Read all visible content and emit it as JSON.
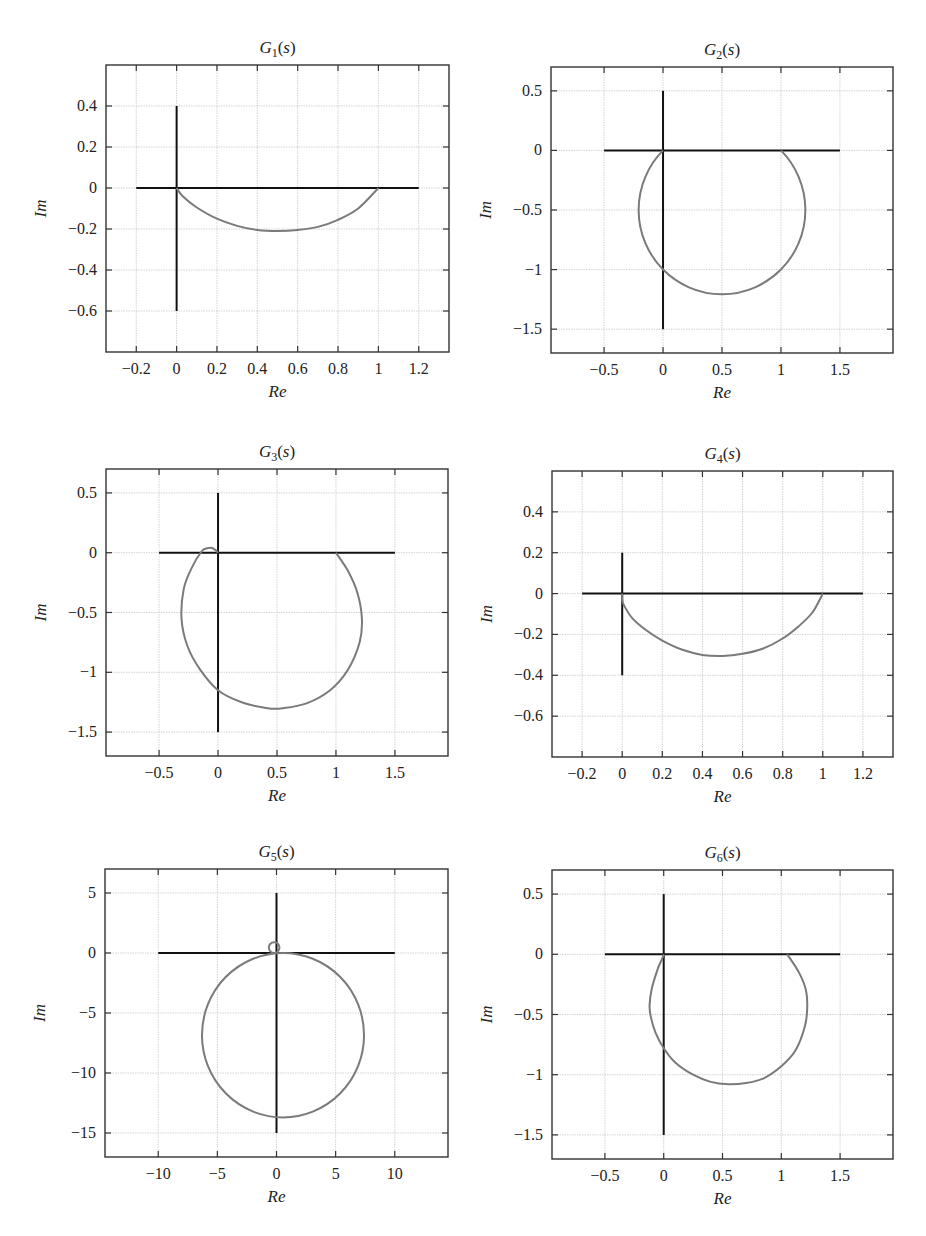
{
  "figure": {
    "layout": "3x2 grid of Nyquist plots"
  },
  "chart_data": [
    {
      "id": "g1",
      "type": "line",
      "title": "G1(s)",
      "title_parts": {
        "base": "G",
        "sub": "1",
        "arg": "s"
      },
      "xlabel": "Re",
      "ylabel": "Im",
      "xlim": [
        -0.35,
        1.35
      ],
      "ylim": [
        -0.8,
        0.6
      ],
      "xticks": [
        -0.2,
        0,
        0.2,
        0.4,
        0.6,
        0.8,
        1,
        1.2
      ],
      "xtick_labels": [
        "−0.2",
        "0",
        "0.2",
        "0.4",
        "0.6",
        "0.8",
        "1",
        "1.2"
      ],
      "yticks": [
        0.4,
        0.2,
        0,
        -0.2,
        -0.4,
        -0.6
      ],
      "ytick_labels": [
        "0.4",
        "0.2",
        "0",
        "−0.2",
        "−0.4",
        "−0.6"
      ],
      "grid": true,
      "box_px": {
        "left": 106,
        "top": 65,
        "right": 449,
        "bottom": 352
      },
      "axes_lines": {
        "h": [
          -0.2,
          1.2,
          0
        ],
        "v": [
          0,
          -0.6,
          0.4
        ]
      },
      "series": [
        {
          "name": "Nyquist curve",
          "shape": "arc",
          "points": [
            [
              1,
              0
            ],
            [
              0.9,
              -0.1
            ],
            [
              0.8,
              -0.155
            ],
            [
              0.7,
              -0.19
            ],
            [
              0.6,
              -0.205
            ],
            [
              0.5,
              -0.21
            ],
            [
              0.4,
              -0.205
            ],
            [
              0.3,
              -0.185
            ],
            [
              0.2,
              -0.15
            ],
            [
              0.1,
              -0.095
            ],
            [
              0.03,
              -0.04
            ],
            [
              0,
              0
            ]
          ]
        }
      ]
    },
    {
      "id": "g2",
      "type": "line",
      "title": "G2(s)",
      "title_parts": {
        "base": "G",
        "sub": "2",
        "arg": "s"
      },
      "xlabel": "Re",
      "ylabel": "Im",
      "xlim": [
        -0.95,
        1.95
      ],
      "ylim": [
        -1.7,
        0.7
      ],
      "xticks": [
        -0.5,
        0,
        0.5,
        1,
        1.5
      ],
      "xtick_labels": [
        "−0.5",
        "0",
        "0.5",
        "1",
        "1.5"
      ],
      "yticks": [
        0.5,
        0,
        -0.5,
        -1,
        -1.5
      ],
      "ytick_labels": [
        "0.5",
        "0",
        "−0.5",
        "−1",
        "−1.5"
      ],
      "grid": true,
      "box_px": {
        "left": 551,
        "top": 67,
        "right": 893,
        "bottom": 353
      },
      "axes_lines": {
        "h": [
          -0.5,
          1.5,
          0
        ],
        "v": [
          0,
          -1.5,
          0.5
        ]
      },
      "series": [
        {
          "name": "Nyquist curve",
          "shape": "circle",
          "center": [
            0.5,
            -0.5
          ],
          "radius": 0.707,
          "from": [
            1,
            0
          ],
          "to": [
            0,
            0
          ],
          "clockwise": true
        }
      ]
    },
    {
      "id": "g3",
      "type": "line",
      "title": "G3(s)",
      "title_parts": {
        "base": "G",
        "sub": "3",
        "arg": "s"
      },
      "xlabel": "Re",
      "ylabel": "Im",
      "xlim": [
        -0.95,
        1.95
      ],
      "ylim": [
        -1.7,
        0.7
      ],
      "xticks": [
        -0.5,
        0,
        0.5,
        1,
        1.5
      ],
      "xtick_labels": [
        "−0.5",
        "0",
        "0.5",
        "1",
        "1.5"
      ],
      "yticks": [
        0.5,
        0,
        -0.5,
        -1,
        -1.5
      ],
      "ytick_labels": [
        "0.5",
        "0",
        "−0.5",
        "−1",
        "−1.5"
      ],
      "grid": true,
      "box_px": {
        "left": 106,
        "top": 469,
        "right": 448,
        "bottom": 756
      },
      "axes_lines": {
        "h": [
          -0.5,
          1.5,
          0
        ],
        "v": [
          0,
          -1.5,
          0.5
        ]
      },
      "series": [
        {
          "name": "Nyquist curve",
          "shape": "polyline",
          "points": [
            [
              1,
              0
            ],
            [
              1.1,
              -0.15
            ],
            [
              1.18,
              -0.33
            ],
            [
              1.22,
              -0.55
            ],
            [
              1.2,
              -0.75
            ],
            [
              1.1,
              -0.98
            ],
            [
              0.95,
              -1.15
            ],
            [
              0.75,
              -1.26
            ],
            [
              0.55,
              -1.3
            ],
            [
              0.42,
              -1.3
            ],
            [
              0.2,
              -1.25
            ],
            [
              0,
              -1.15
            ],
            [
              -0.15,
              -0.98
            ],
            [
              -0.26,
              -0.78
            ],
            [
              -0.31,
              -0.55
            ],
            [
              -0.29,
              -0.3
            ],
            [
              -0.22,
              -0.12
            ],
            [
              -0.14,
              0.01
            ],
            [
              -0.1,
              0.035
            ],
            [
              -0.05,
              0.04
            ],
            [
              -0.02,
              0.02
            ],
            [
              0,
              0
            ]
          ]
        }
      ]
    },
    {
      "id": "g4",
      "type": "line",
      "title": "G4(s)",
      "title_parts": {
        "base": "G",
        "sub": "4",
        "arg": "s"
      },
      "xlabel": "Re",
      "ylabel": "Im",
      "xlim": [
        -0.35,
        1.35
      ],
      "ylim": [
        -0.8,
        0.6
      ],
      "xticks": [
        -0.2,
        0,
        0.2,
        0.4,
        0.6,
        0.8,
        1,
        1.2
      ],
      "xtick_labels": [
        "−0.2",
        "0",
        "0.2",
        "0.4",
        "0.6",
        "0.8",
        "1",
        "1.2"
      ],
      "yticks": [
        0.4,
        0.2,
        0,
        -0.2,
        -0.4,
        -0.6
      ],
      "ytick_labels": [
        "0.4",
        "0.2",
        "0",
        "−0.2",
        "−0.4",
        "−0.6"
      ],
      "grid": true,
      "box_px": {
        "left": 552,
        "top": 471,
        "right": 893,
        "bottom": 757
      },
      "axes_lines": {
        "h": [
          -0.2,
          1.2,
          0
        ],
        "v": [
          0,
          -0.4,
          0.2
        ]
      },
      "series": [
        {
          "name": "Nyquist curve",
          "shape": "polyline",
          "points": [
            [
              1,
              0
            ],
            [
              0.95,
              -0.09
            ],
            [
              0.88,
              -0.16
            ],
            [
              0.8,
              -0.22
            ],
            [
              0.7,
              -0.27
            ],
            [
              0.6,
              -0.295
            ],
            [
              0.5,
              -0.305
            ],
            [
              0.4,
              -0.3
            ],
            [
              0.3,
              -0.275
            ],
            [
              0.2,
              -0.23
            ],
            [
              0.12,
              -0.18
            ],
            [
              0.05,
              -0.12
            ],
            [
              0.01,
              -0.06
            ],
            [
              0,
              -0.03
            ],
            [
              0,
              0
            ]
          ]
        }
      ]
    },
    {
      "id": "g5",
      "type": "line",
      "title": "G5(s)",
      "title_parts": {
        "base": "G",
        "sub": "5",
        "arg": "s"
      },
      "xlabel": "Re",
      "ylabel": "Im",
      "xlim": [
        -14.5,
        14.5
      ],
      "ylim": [
        -17,
        7
      ],
      "xticks": [
        -10,
        -5,
        0,
        5,
        10
      ],
      "xtick_labels": [
        "−10",
        "−5",
        "0",
        "5",
        "10"
      ],
      "yticks": [
        5,
        0,
        -5,
        -10,
        -15
      ],
      "ytick_labels": [
        "5",
        "0",
        "−5",
        "−10",
        "−15"
      ],
      "grid": true,
      "box_px": {
        "left": 105,
        "top": 869,
        "right": 448,
        "bottom": 1157
      },
      "axes_lines": {
        "h": [
          -10,
          10,
          0
        ],
        "v": [
          0,
          -15,
          5
        ]
      },
      "series": [
        {
          "name": "Nyquist curve (large loop)",
          "shape": "circle",
          "center": [
            0.55,
            -6.85
          ],
          "radius": 6.85,
          "from": [
            0,
            0
          ],
          "to": [
            0,
            0
          ],
          "full": true
        },
        {
          "name": "Nyquist curve (small loop)",
          "shape": "circle",
          "center": [
            -0.2,
            0.45
          ],
          "radius": 0.45,
          "full": true
        }
      ]
    },
    {
      "id": "g6",
      "type": "line",
      "title": "G6(s)",
      "title_parts": {
        "base": "G",
        "sub": "6",
        "arg": "s"
      },
      "xlabel": "Re",
      "ylabel": "Im",
      "xlim": [
        -0.95,
        1.95
      ],
      "ylim": [
        -1.7,
        0.7
      ],
      "xticks": [
        -0.5,
        0,
        0.5,
        1,
        1.5
      ],
      "xtick_labels": [
        "−0.5",
        "0",
        "0.5",
        "1",
        "1.5"
      ],
      "yticks": [
        0.5,
        0,
        -0.5,
        -1,
        -1.5
      ],
      "ytick_labels": [
        "0.5",
        "0",
        "−0.5",
        "−1",
        "−1.5"
      ],
      "grid": true,
      "box_px": {
        "left": 552,
        "top": 870,
        "right": 893,
        "bottom": 1159
      },
      "axes_lines": {
        "h": [
          -0.5,
          1.5,
          0
        ],
        "v": [
          0,
          -1.5,
          0.5
        ]
      },
      "series": [
        {
          "name": "Nyquist curve",
          "shape": "polyline",
          "points": [
            [
              1.05,
              0
            ],
            [
              1.15,
              -0.15
            ],
            [
              1.21,
              -0.3
            ],
            [
              1.22,
              -0.45
            ],
            [
              1.2,
              -0.6
            ],
            [
              1.12,
              -0.8
            ],
            [
              1.0,
              -0.93
            ],
            [
              0.85,
              -1.03
            ],
            [
              0.7,
              -1.07
            ],
            [
              0.55,
              -1.08
            ],
            [
              0.4,
              -1.06
            ],
            [
              0.25,
              -1.0
            ],
            [
              0.1,
              -0.9
            ],
            [
              0,
              -0.78
            ],
            [
              -0.07,
              -0.65
            ],
            [
              -0.11,
              -0.52
            ],
            [
              -0.12,
              -0.42
            ],
            [
              -0.1,
              -0.28
            ],
            [
              -0.05,
              -0.12
            ],
            [
              -0.01,
              -0.03
            ],
            [
              0,
              0
            ]
          ]
        }
      ]
    }
  ]
}
